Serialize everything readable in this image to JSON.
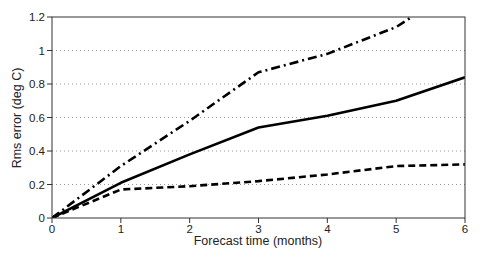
{
  "chart_data": {
    "type": "line",
    "title": "",
    "xlabel": "Forecast time (months)",
    "ylabel": "Rms error (deg C)",
    "xlim": [
      0,
      6
    ],
    "ylim": [
      0,
      1.2
    ],
    "xticks": [
      "0",
      "1",
      "2",
      "3",
      "4",
      "5",
      "6"
    ],
    "yticks": [
      "0",
      "0.2",
      "0.4",
      "0.6",
      "0.8",
      "1",
      "1.2"
    ],
    "grid": "horizontal dotted",
    "legend": "none",
    "x": [
      0,
      1,
      2,
      3,
      4,
      5,
      6
    ],
    "series": [
      {
        "name": "solid",
        "style": "solid",
        "values": [
          0,
          0.21,
          0.38,
          0.54,
          0.61,
          0.7,
          0.84
        ]
      },
      {
        "name": "dashed",
        "style": "dashed",
        "values": [
          0,
          0.17,
          0.19,
          0.22,
          0.26,
          0.31,
          0.32
        ]
      },
      {
        "name": "dash-dot",
        "style": "dashdot",
        "values": [
          0,
          0.31,
          0.58,
          0.87,
          0.98,
          1.14,
          null
        ],
        "note": "exits top of plot (1.2) at about month 5.3"
      }
    ]
  }
}
